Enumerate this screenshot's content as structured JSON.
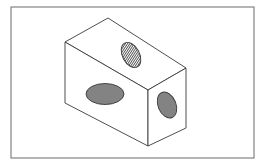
{
  "document": {
    "title": "Isometric Block with Three Elliptical Holes",
    "kind": "technical-line-drawing",
    "background_color": "#ffffff",
    "width": 266,
    "height": 166
  },
  "frame": {
    "name": "drawing-border",
    "x": 11,
    "y": 7,
    "width": 243,
    "height": 151,
    "stroke_color": "#777777",
    "stroke_width": 1.1,
    "fill": "none"
  },
  "figure": {
    "name": "isometric-rectangular-block",
    "stroke_color": "#3a3a3a",
    "stroke_width": 0.9,
    "face_fill": "#ffffff",
    "vertices": {
      "top_back": {
        "x": 108,
        "y": 18
      },
      "top_left": {
        "x": 65,
        "y": 42
      },
      "top_front": {
        "x": 148,
        "y": 90
      },
      "top_right": {
        "x": 186,
        "y": 68
      },
      "bottom_left": {
        "x": 65,
        "y": 103
      },
      "bottom_front": {
        "x": 148,
        "y": 146
      },
      "bottom_right": {
        "x": 186,
        "y": 128
      }
    },
    "faces": [
      {
        "name": "top-face",
        "points": "108,18 65,42 148,90 186,68",
        "shading": "none"
      },
      {
        "name": "front-left-face",
        "points": "65,42 65,103 148,146 148,90",
        "shading": "none"
      },
      {
        "name": "right-face",
        "points": "148,90 148,146 186,128 186,68",
        "shading": "none"
      }
    ]
  },
  "holes": [
    {
      "name": "hole-top-face",
      "label": "top elliptical hole",
      "cx": 131,
      "cy": 55,
      "rx": 8.5,
      "ry": 13.5,
      "rotation": -28,
      "hatch": "vertical-lines",
      "hatch_color": "#4a4a4a",
      "hatch_spacing": 1.6,
      "stroke_color": "#3a3a3a"
    },
    {
      "name": "hole-front-face",
      "label": "front elliptical hole",
      "cx": 105,
      "cy": 94,
      "rx": 19,
      "ry": 10.5,
      "rotation": 0,
      "hatch": "cross-hatch",
      "hatch_color": "#555555",
      "hatch_spacing": 1.5,
      "stroke_color": "#3a3a3a"
    },
    {
      "name": "hole-right-face",
      "label": "right elliptical hole",
      "cx": 167,
      "cy": 105,
      "rx": 9,
      "ry": 13.5,
      "rotation": -22,
      "hatch": "cross-hatch",
      "hatch_color": "#555555",
      "hatch_spacing": 1.5,
      "stroke_color": "#3a3a3a"
    }
  ]
}
